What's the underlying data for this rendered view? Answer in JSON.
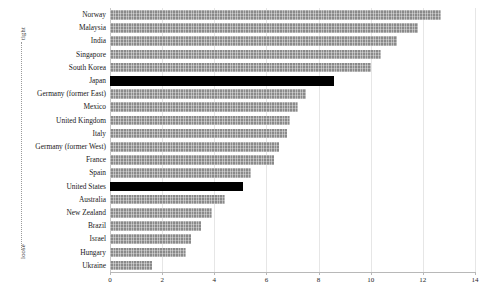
{
  "chart_data": {
    "type": "bar",
    "orientation": "horizontal",
    "title": "",
    "subtitle": "",
    "xlabel": "",
    "ylabel": "",
    "xlim": [
      0,
      14
    ],
    "xticks": [
      0,
      2,
      4,
      6,
      8,
      10,
      12,
      14
    ],
    "grid": true,
    "legend": null,
    "categories": [
      "Norway",
      "Malaysia",
      "India",
      "Singapore",
      "South Korea",
      "Japan",
      "Germany (former East)",
      "Mexico",
      "United Kingdom",
      "Italy",
      "Germany (former West)",
      "France",
      "Spain",
      "United States",
      "Australia",
      "New Zealand",
      "Brazil",
      "Israel",
      "Hungary",
      "Ukraine"
    ],
    "values": [
      12.7,
      11.8,
      11.0,
      10.4,
      10.0,
      8.6,
      7.5,
      7.2,
      6.9,
      6.8,
      6.5,
      6.3,
      5.4,
      5.1,
      4.4,
      3.9,
      3.5,
      3.1,
      2.9,
      1.6
    ],
    "highlighted": [
      "Japan",
      "United States"
    ],
    "colors": {
      "bar": "#8a8a8a",
      "bar_highlight": "#000000",
      "grid": "#e6e6e6",
      "axis": "#b8b8b8",
      "text": "#1a1a1a"
    }
  },
  "annotation_axis": {
    "top_label": "tight",
    "bottom_label": "loose"
  }
}
